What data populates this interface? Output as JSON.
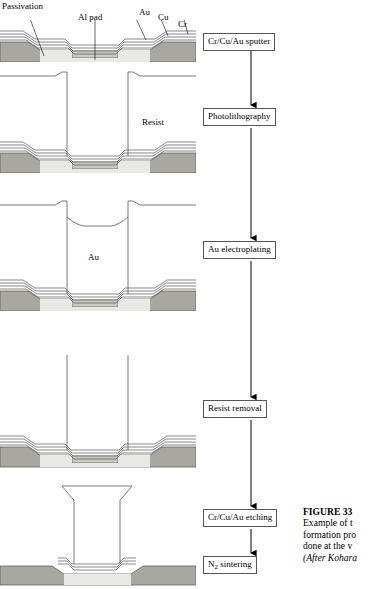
{
  "figure": {
    "caption_title": "FIGURE 33",
    "caption_lines": [
      "Example of t",
      "formation pro",
      "done at the v"
    ],
    "caption_source": "(After Kohara"
  },
  "cross_section_labels": {
    "passivation": "Passivation",
    "al_pad": "Al pad",
    "au": "Au",
    "cu": "Cu",
    "cr": "Cr",
    "resist": "Resist",
    "au_plated": "Au"
  },
  "process_flow": {
    "steps": [
      {
        "label": "Cr/Cu/Au sputter"
      },
      {
        "label": "Photolithography"
      },
      {
        "label": "Au electroplating"
      },
      {
        "label": "Resist removal"
      },
      {
        "label": "Cr/Cu/Au etching"
      },
      {
        "label": "N2 sintering",
        "label_pre": "N",
        "label_sub": "2",
        "label_post": " sintering"
      }
    ]
  },
  "colors": {
    "passivation_fill": "#a8a8a0",
    "substrate_fill": "#c8c8c2",
    "film_line": "#555555",
    "box_border": "#555555",
    "arrow": "#000000"
  }
}
